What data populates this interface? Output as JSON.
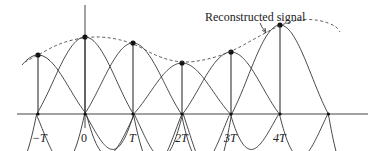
{
  "diagram": {
    "annotation": "Reconstructed signal",
    "tick_labels": [
      "−T",
      "0",
      "T",
      "2T",
      "3T",
      "4T"
    ],
    "colors": {
      "line": "#333333",
      "background": "#ffffff"
    },
    "baseline_y": 114,
    "samples": [
      {
        "label": "−T",
        "x": 38,
        "y": 55
      },
      {
        "label": "0",
        "x": 85,
        "y": 37
      },
      {
        "label": "T",
        "x": 133,
        "y": 43
      },
      {
        "label": "2T",
        "x": 182,
        "y": 63
      },
      {
        "label": "3T",
        "x": 231,
        "y": 52
      },
      {
        "label": "4T",
        "x": 280,
        "y": 25
      }
    ]
  }
}
